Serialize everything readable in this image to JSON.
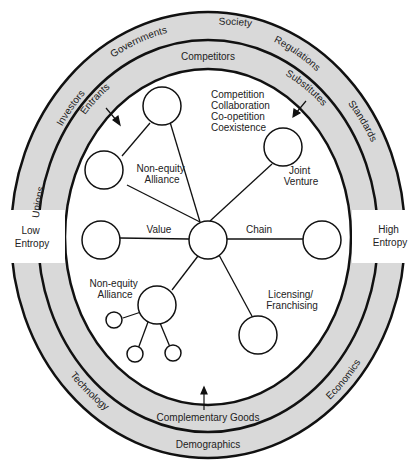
{
  "diagram": {
    "outer_band": {
      "labels": [
        "Unions",
        "Investors",
        "Governments",
        "Society",
        "Regulations",
        "Standards",
        "Economics",
        "Demographics",
        "Technology"
      ]
    },
    "middle_band": {
      "labels": [
        "Entrants",
        "Competitors",
        "Substitutes",
        "Complementary Goods"
      ]
    },
    "sides": {
      "left": [
        "Low",
        "Entropy"
      ],
      "right": [
        "High",
        "Entropy"
      ]
    },
    "modes": [
      "Competition",
      "Collaboration",
      "Co-opetition",
      "Coexistence"
    ],
    "nodes": {
      "top_left_alliance": [
        "Non-equity",
        "Alliance"
      ],
      "joint_venture": [
        "Joint",
        "Venture"
      ],
      "value": "Value",
      "chain": "Chain",
      "bottom_alliance": [
        "Non-equity",
        "Alliance"
      ],
      "licensing": [
        "Licensing/",
        "Franchising"
      ]
    },
    "colors": {
      "band_fill": "#d9d9d9",
      "stroke": "#111111",
      "background": "#ffffff"
    }
  }
}
